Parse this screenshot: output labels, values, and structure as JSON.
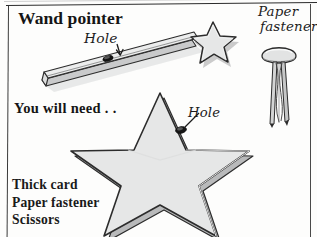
{
  "page": {
    "title": "Wand pointer",
    "you_will_need": "You will need . .",
    "materials": [
      "Thick card",
      "Paper fastener",
      "Scissors"
    ],
    "callouts": {
      "hole_wand": "Hole",
      "hole_star": "Hole",
      "paper_fastener_line1": "Paper",
      "paper_fastener_line2": "fastener"
    },
    "colors": {
      "ink": "#1a1a1a",
      "card_fill": "#e6e7e7",
      "card_fill_shadow": "#cfd0d0",
      "outline": "#2c2c2c",
      "hole": "#141414",
      "paper": "#fdfdfc"
    },
    "illustrations": [
      {
        "name": "wand-stick",
        "label": "wooden stick with hole"
      },
      {
        "name": "wand-star-tip",
        "label": "small star on wand tip"
      },
      {
        "name": "big-card-star",
        "label": "large thick card star with hole"
      },
      {
        "name": "paper-fastener",
        "label": "split pin paper fastener"
      }
    ]
  }
}
